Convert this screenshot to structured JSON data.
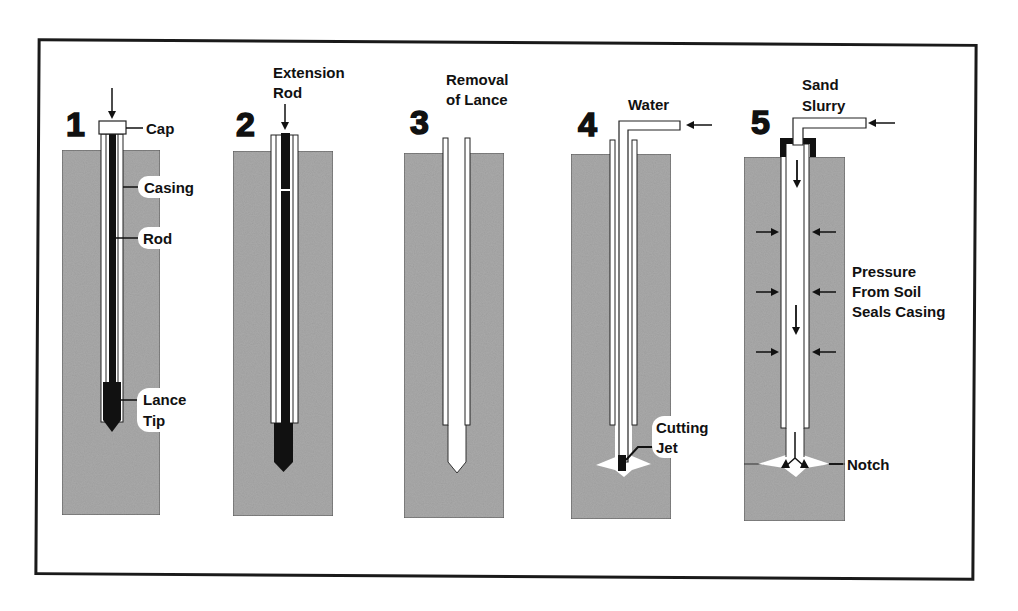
{
  "diagram": {
    "colors": {
      "soil": "#a9a9a9",
      "soil_edge": "#555555",
      "ink": "#111111",
      "background": "#ffffff"
    },
    "steps": [
      {
        "number": "1",
        "title": "",
        "labels": {
          "cap": "Cap",
          "casing": "Casing",
          "rod": "Rod",
          "lance_line1": "Lance",
          "lance_line2": "Tip"
        }
      },
      {
        "number": "2",
        "title_line1": "Extension",
        "title_line2": "Rod"
      },
      {
        "number": "3",
        "title_line1": "Removal",
        "title_line2": "of Lance"
      },
      {
        "number": "4",
        "title": "Water",
        "labels": {
          "jet_line1": "Cutting",
          "jet_line2": "Jet"
        }
      },
      {
        "number": "5",
        "title_line1": "Sand",
        "title_line2": "Slurry",
        "labels": {
          "pressure_line1": "Pressure",
          "pressure_line2": "From Soil",
          "pressure_line3": "Seals Casing",
          "notch": "Notch"
        }
      }
    ],
    "icons": [
      "down-arrow-icon",
      "left-arrow-icon",
      "right-arrow-icon"
    ]
  }
}
